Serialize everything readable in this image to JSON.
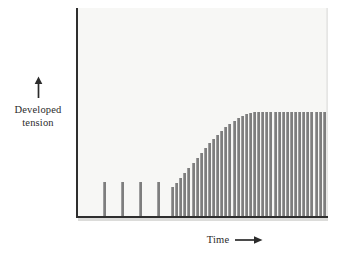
{
  "figure": {
    "background_color": "#ffffff",
    "panel_color": "#f7f7f5",
    "axis_color": "#2e2e2e",
    "bar_color": "#7e7e7e"
  },
  "axes": {
    "y_label_line1": "Developed",
    "y_label_line2": "tension",
    "y_arrow_icon": "up-arrow-icon",
    "x_label": "Time",
    "x_arrow_icon": "right-arrow-icon"
  },
  "chart_data": {
    "type": "bar",
    "title": "",
    "xlabel": "Time",
    "ylabel": "Developed tension",
    "grid": false,
    "legend": null,
    "xlim": [
      0,
      251
    ],
    "ylim": [
      0,
      209
    ],
    "axis_tick_labels": {
      "x": [],
      "y": []
    },
    "series": [
      {
        "name": "Isolated twitches",
        "bar_width_px": 2,
        "x": [
          26,
          44,
          62,
          80
        ],
        "values": [
          35,
          35,
          35,
          35
        ]
      },
      {
        "name": "Tetanic stimulus train",
        "bar_width_px": 2,
        "x": [
          94,
          98.1,
          102.2,
          106.3,
          110.4,
          114.5,
          118.6,
          122.7,
          126.8,
          130.9,
          135.0,
          139.1,
          143.2,
          147.3,
          151.4,
          155.5,
          159.6,
          163.7,
          167.8,
          171.9,
          176.0,
          180.1,
          184.2,
          188.3,
          192.4,
          196.5,
          200.6,
          204.7,
          208.8,
          212.9,
          217.0,
          221.1,
          225.2,
          229.3,
          233.4,
          237.5,
          241.6,
          245.7
        ],
        "values": [
          30,
          34,
          39,
          44,
          49,
          54,
          59,
          64,
          69,
          74,
          78,
          82,
          86,
          90,
          93,
          96,
          99,
          101,
          103,
          104,
          105,
          105,
          105,
          105,
          105,
          105,
          105,
          105,
          105,
          105,
          105,
          105,
          105,
          105,
          105,
          105,
          105,
          105
        ]
      }
    ]
  }
}
